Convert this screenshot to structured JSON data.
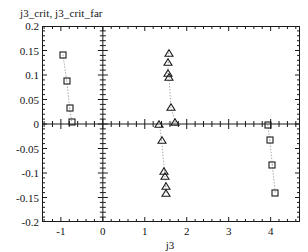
{
  "chart_data": {
    "type": "scatter",
    "title": "j3_crit, j3_crit_far",
    "xlabel": "j3",
    "ylabel": "",
    "xlim": [
      -1.45,
      4.7
    ],
    "ylim": [
      -0.2,
      0.2
    ],
    "grid": false,
    "legend": "none",
    "xticks": [
      -1,
      0,
      1,
      2,
      3,
      4
    ],
    "xtick_labels": [
      "-1",
      "0",
      "1",
      "2",
      "3",
      "4"
    ],
    "yticks": [
      0.2,
      0.15,
      0.1,
      0.05,
      0,
      -0.05,
      -0.1,
      -0.15,
      -0.2
    ],
    "ytick_labels": [
      "0.2",
      "0.15",
      "0.1",
      "0.05",
      "0",
      "-0.05",
      "-0.1",
      "-0.15",
      "-0.2"
    ],
    "axis_lines": {
      "x_zero": 0,
      "y_zero": 0
    },
    "series": [
      {
        "name": "j3_crit",
        "marker": "square",
        "linestyle": "dotted",
        "points": [
          {
            "x": -0.95,
            "y": 0.141
          },
          {
            "x": -0.86,
            "y": 0.088
          },
          {
            "x": -0.79,
            "y": 0.032
          },
          {
            "x": -0.74,
            "y": 0.004
          },
          {
            "x": 3.93,
            "y": -0.002
          },
          {
            "x": 3.98,
            "y": -0.033
          },
          {
            "x": 4.04,
            "y": -0.083
          },
          {
            "x": 4.11,
            "y": -0.14
          }
        ]
      },
      {
        "name": "j3_crit_far",
        "marker": "triangle",
        "linestyle": "dotted",
        "points": [
          {
            "x": 1.57,
            "y": 0.145
          },
          {
            "x": 1.56,
            "y": 0.126
          },
          {
            "x": 1.55,
            "y": 0.104
          },
          {
            "x": 1.58,
            "y": 0.095
          },
          {
            "x": 1.62,
            "y": 0.035
          },
          {
            "x": 1.73,
            "y": 0.004
          },
          {
            "x": 1.35,
            "y": 0.0
          },
          {
            "x": 1.4,
            "y": -0.033
          },
          {
            "x": 1.47,
            "y": -0.095
          },
          {
            "x": 1.48,
            "y": -0.107
          },
          {
            "x": 1.5,
            "y": -0.127
          },
          {
            "x": 1.51,
            "y": -0.14
          }
        ]
      }
    ]
  }
}
